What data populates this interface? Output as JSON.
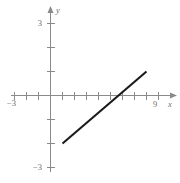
{
  "figure": {
    "background_color": "#ffffff",
    "axis_color": "#8a8a8a",
    "line_color": "#1a1a1a",
    "label_color": "#6e6e6e"
  },
  "labels": {
    "x_axis_name": "x",
    "y_axis_name": "y",
    "x_left": "−3",
    "x_right": "9",
    "y_top": "3",
    "y_bottom": "−3"
  },
  "chart_data": {
    "type": "line",
    "title": "",
    "xlabel": "x",
    "ylabel": "y",
    "xlim": [
      -3.5,
      10.5
    ],
    "ylim": [
      -3.4,
      3.4
    ],
    "grid": false,
    "legend": null,
    "x_ticks": [
      -3,
      -2,
      -1,
      0,
      1,
      2,
      3,
      4,
      5,
      6,
      7,
      8,
      9
    ],
    "x_tick_labels": [
      "−3",
      "",
      "",
      "",
      "",
      "",
      "",
      "",
      "",
      "",
      "",
      "",
      "9"
    ],
    "y_ticks": [
      -3,
      -2,
      -1,
      0,
      1,
      2,
      3
    ],
    "y_tick_labels": [
      "−3",
      "",
      "",
      "",
      "",
      "",
      "3"
    ],
    "series": [
      {
        "name": "line segment",
        "x": [
          1,
          8
        ],
        "y": [
          -2,
          1
        ],
        "slope": 0.4286,
        "x_intercept": 6,
        "y_intercept": -2.4286,
        "endpoints": [
          [
            1,
            -2
          ],
          [
            8,
            1
          ]
        ]
      }
    ]
  }
}
